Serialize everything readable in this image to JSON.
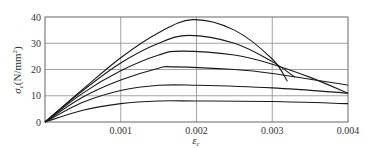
{
  "chart_data": {
    "type": "line",
    "title": "",
    "xlabel": "ε_c",
    "xlabel_main": "ε",
    "xlabel_sub": "c",
    "ylabel": "σ_c(N/mm²)",
    "ylabel_main": "σ",
    "ylabel_sub": "c",
    "ylabel_unit": "(N/mm",
    "ylabel_unit_sup": "2",
    "ylabel_unit_close": ")",
    "xlim": [
      0,
      0.004
    ],
    "ylim": [
      0,
      40
    ],
    "grid": true,
    "legend": "none",
    "x_ticks": [
      0.001,
      0.002,
      0.003,
      0.004
    ],
    "x_tick_labels": [
      "0.001",
      "0.002",
      "0.003",
      "0.004"
    ],
    "y_ticks": [
      0,
      10,
      20,
      30,
      40
    ],
    "y_tick_labels": [
      "0",
      "10",
      "20",
      "30",
      "40"
    ],
    "series": [
      {
        "name": "curve-1",
        "x": [
          0,
          0.0005,
          0.001,
          0.0015,
          0.00195,
          0.0025,
          0.003,
          0.0032
        ],
        "y": [
          0,
          12.5,
          24.5,
          34,
          39,
          35,
          24,
          15.5
        ]
      },
      {
        "name": "curve-2",
        "x": [
          0,
          0.0005,
          0.001,
          0.0015,
          0.0019,
          0.0025,
          0.003,
          0.0033
        ],
        "y": [
          0,
          12,
          22.5,
          30,
          33,
          30,
          23,
          17
        ]
      },
      {
        "name": "curve-3",
        "x": [
          0,
          0.0005,
          0.001,
          0.0015,
          0.0018,
          0.0025,
          0.003,
          0.0035,
          0.004
        ],
        "y": [
          0,
          11,
          19.5,
          25.5,
          27,
          25.5,
          22,
          17,
          11
        ]
      },
      {
        "name": "curve-4",
        "x": [
          0,
          0.0005,
          0.001,
          0.0015,
          0.0017,
          0.0025,
          0.003,
          0.004
        ],
        "y": [
          0,
          9.5,
          16,
          20.5,
          21,
          20,
          18.5,
          14
        ]
      },
      {
        "name": "curve-5",
        "x": [
          0,
          0.0005,
          0.001,
          0.0015,
          0.002,
          0.003,
          0.004
        ],
        "y": [
          0,
          7.5,
          12,
          14,
          14,
          13,
          11
        ]
      },
      {
        "name": "curve-6",
        "x": [
          0,
          0.0005,
          0.001,
          0.0015,
          0.002,
          0.003,
          0.004
        ],
        "y": [
          0,
          4.5,
          7,
          8,
          8,
          7.8,
          7
        ]
      }
    ]
  },
  "colors": {
    "line": "#1a1a1a",
    "grid": "#8c8c8c",
    "frame": "#666666",
    "text": "#333333",
    "background": "#ffffff"
  },
  "layout": {
    "plot_left": 45,
    "plot_right": 348,
    "plot_top": 17,
    "plot_bottom": 122
  }
}
